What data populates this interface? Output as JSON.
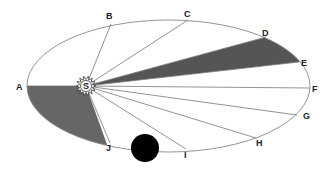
{
  "diagram": {
    "sun": {
      "label": "S",
      "x": 86,
      "y": 86
    },
    "orbit": {
      "cx": 168.5,
      "cy": 86,
      "rx": 141.5,
      "ry": 66
    },
    "points": [
      {
        "label": "A",
        "x": 27,
        "y": 86,
        "lx": 16,
        "ly": 90
      },
      {
        "label": "B",
        "x": 111,
        "y": 24,
        "lx": 106,
        "ly": 19
      },
      {
        "label": "C",
        "x": 188,
        "y": 20,
        "lx": 184,
        "ly": 17
      },
      {
        "label": "D",
        "x": 266,
        "y": 37,
        "lx": 262,
        "ly": 36
      },
      {
        "label": "E",
        "x": 299,
        "y": 62,
        "lx": 301,
        "ly": 66
      },
      {
        "label": "F",
        "x": 310,
        "y": 88,
        "lx": 312,
        "ly": 92
      },
      {
        "label": "G",
        "x": 297,
        "y": 115,
        "lx": 303,
        "ly": 119
      },
      {
        "label": "H",
        "x": 256,
        "y": 138,
        "lx": 256,
        "ly": 146
      },
      {
        "label": "I",
        "x": 186,
        "y": 149,
        "lx": 184,
        "ly": 158
      },
      {
        "label": "J",
        "x": 110,
        "y": 143,
        "lx": 106,
        "ly": 151
      }
    ],
    "shaded_sectors": [
      {
        "from": "D",
        "to": "E",
        "color": "#555555"
      },
      {
        "from": "A",
        "to": "J",
        "color": "#666666"
      }
    ],
    "planet": {
      "x": 145,
      "y": 148,
      "r": 14,
      "color": "#000000"
    },
    "colors": {
      "orbit": "#888888",
      "rays": "#777777",
      "background": "#ffffff"
    }
  }
}
